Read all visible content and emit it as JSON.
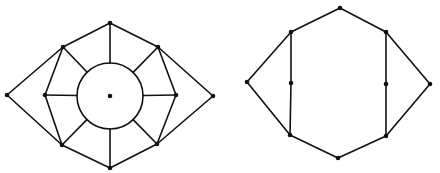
{
  "figure": {
    "stroke_color": "#111111",
    "background": "#ffffff"
  },
  "graphs": [
    {
      "name": "left-graph",
      "vertices": [
        {
          "id": "top",
          "x": 110,
          "y": 23
        },
        {
          "id": "ul",
          "x": 63,
          "y": 47
        },
        {
          "id": "ur",
          "x": 158,
          "y": 47
        },
        {
          "id": "fl",
          "x": 7,
          "y": 95
        },
        {
          "id": "ml",
          "x": 45,
          "y": 95
        },
        {
          "id": "mr",
          "x": 176,
          "y": 95
        },
        {
          "id": "fr",
          "x": 213,
          "y": 96
        },
        {
          "id": "ll",
          "x": 62,
          "y": 145
        },
        {
          "id": "lr",
          "x": 157,
          "y": 144
        },
        {
          "id": "bot",
          "x": 110,
          "y": 168
        },
        {
          "id": "center",
          "x": 110,
          "y": 96
        }
      ],
      "circle": {
        "cx": 110,
        "cy": 96,
        "r": 33
      },
      "edges": [
        [
          "top",
          "ul"
        ],
        [
          "top",
          "ur"
        ],
        [
          "ul",
          "fl"
        ],
        [
          "ur",
          "fr"
        ],
        [
          "fl",
          "ll"
        ],
        [
          "fr",
          "lr"
        ],
        [
          "ll",
          "bot"
        ],
        [
          "lr",
          "bot"
        ],
        [
          "ul",
          "ml"
        ],
        [
          "ml",
          "ll"
        ],
        [
          "ur",
          "mr"
        ],
        [
          "mr",
          "lr"
        ]
      ],
      "spokes": [
        {
          "from": "top",
          "angle_deg": 270
        },
        {
          "from": "ur",
          "angle_deg": 315
        },
        {
          "from": "mr",
          "angle_deg": 0
        },
        {
          "from": "lr",
          "angle_deg": 45
        },
        {
          "from": "bot",
          "angle_deg": 90
        },
        {
          "from": "ll",
          "angle_deg": 135
        },
        {
          "from": "ml",
          "angle_deg": 180
        },
        {
          "from": "ul",
          "angle_deg": 225
        }
      ]
    },
    {
      "name": "right-graph",
      "vertices": [
        {
          "id": "top",
          "x": 340,
          "y": 8
        },
        {
          "id": "ul",
          "x": 291,
          "y": 32
        },
        {
          "id": "ur",
          "x": 386,
          "y": 32
        },
        {
          "id": "fl",
          "x": 247,
          "y": 82
        },
        {
          "id": "ml",
          "x": 291,
          "y": 83
        },
        {
          "id": "mr",
          "x": 386,
          "y": 84
        },
        {
          "id": "fr",
          "x": 430,
          "y": 84
        },
        {
          "id": "ll",
          "x": 290,
          "y": 135
        },
        {
          "id": "lr",
          "x": 386,
          "y": 136
        },
        {
          "id": "bot",
          "x": 338,
          "y": 158
        }
      ],
      "edges": [
        [
          "top",
          "ul"
        ],
        [
          "top",
          "ur"
        ],
        [
          "ul",
          "fl"
        ],
        [
          "fl",
          "ll"
        ],
        [
          "ur",
          "fr"
        ],
        [
          "fr",
          "lr"
        ],
        [
          "ll",
          "bot"
        ],
        [
          "lr",
          "bot"
        ],
        [
          "ul",
          "ml"
        ],
        [
          "ml",
          "ll"
        ],
        [
          "ur",
          "mr"
        ],
        [
          "mr",
          "lr"
        ]
      ]
    }
  ]
}
